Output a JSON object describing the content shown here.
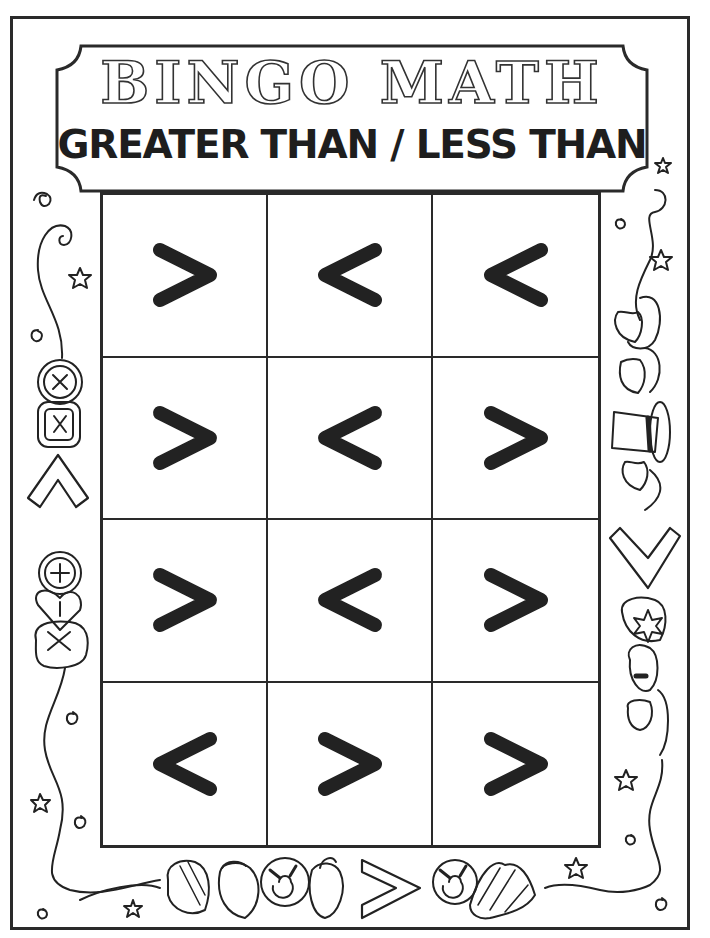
{
  "worksheet": {
    "title": "BINGO MATH",
    "subtitle": "GREATER THAN / LESS THAN"
  },
  "grid": {
    "rows": 4,
    "columns": 3,
    "cells": [
      [
        ">",
        "<",
        "<"
      ],
      [
        ">",
        "<",
        ">"
      ],
      [
        ">",
        "<",
        ">"
      ],
      [
        "<",
        ">",
        ">"
      ]
    ]
  },
  "decorations": {
    "left_border": [
      "spiral-icon",
      "star-icon",
      "button-icon",
      "button-icon",
      "less-than-outline-icon",
      "button-icon",
      "heart-button-icon",
      "button-icon",
      "star-icon",
      "spiral-icon"
    ],
    "right_border": [
      "star-icon",
      "spiral-icon",
      "star-icon",
      "hat-icon",
      "hat-icon",
      "hat-icon",
      "hat-icon",
      "greater-than-outline-icon",
      "hat-icon",
      "star-icon",
      "spiral-icon"
    ],
    "bottom_border": [
      "star-icon",
      "shell-icon",
      "shell-icon",
      "shell-icon",
      "shell-icon",
      "greater-than-outline-icon",
      "shell-icon",
      "shell-icon",
      "star-icon",
      "spiral-icon"
    ]
  },
  "colors": {
    "ink": "#222222",
    "paper": "#ffffff"
  }
}
